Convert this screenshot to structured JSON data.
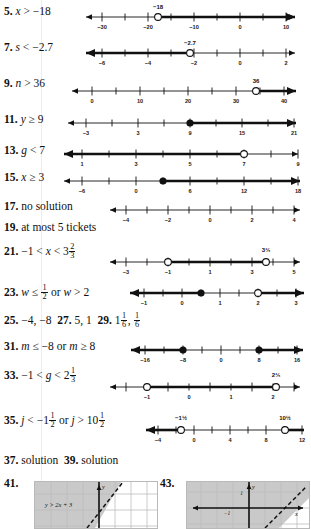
{
  "page": {
    "type": "textbook-answer-key",
    "background": "#ffffff",
    "ink": "#111111"
  },
  "items": [
    {
      "number": "5.",
      "answer": "x > −18",
      "variable": "x",
      "relation": ">",
      "value": "−18",
      "numberline": {
        "ticks": [
          "−30",
          "",
          "−20",
          "",
          "−10",
          "",
          "0",
          "",
          "10"
        ],
        "tick_values": [
          -30,
          -25,
          -20,
          -15,
          -10,
          -5,
          0,
          5,
          10
        ],
        "labeled": [
          -30,
          -20,
          -10,
          0,
          10
        ],
        "point_label": "−18",
        "point": -18,
        "circle": "open",
        "shade": "right",
        "arrow_left": true,
        "arrow_right": true
      }
    },
    {
      "number": "7.",
      "answer": "s < −2.7",
      "variable": "s",
      "relation": "<",
      "value": "−2.7",
      "numberline": {
        "ticks": [
          "−6",
          "",
          "−4",
          "",
          "−2",
          "",
          "0",
          "",
          "2"
        ],
        "tick_values": [
          -6,
          -5,
          -4,
          -3,
          -2,
          -1,
          0,
          1,
          2
        ],
        "labeled": [
          -6,
          -4,
          -2,
          0,
          2
        ],
        "point_label": "−2.7",
        "point": -2.7,
        "circle": "open",
        "shade": "left",
        "arrow_left": true,
        "arrow_right": true
      }
    },
    {
      "number": "9.",
      "answer": "n > 36",
      "variable": "n",
      "relation": ">",
      "value": "36",
      "numberline": {
        "ticks": [
          "0",
          "",
          "10",
          "",
          "20",
          "",
          "30",
          "",
          "40"
        ],
        "tick_values": [
          0,
          5,
          10,
          15,
          20,
          25,
          30,
          35,
          40
        ],
        "labeled": [
          0,
          10,
          20,
          30,
          40
        ],
        "point_label": "36",
        "point": 36,
        "circle": "open",
        "shade": "right",
        "arrow_left": true,
        "arrow_right": true
      }
    },
    {
      "number": "11.",
      "answer": "y ≥ 9",
      "variable": "y",
      "relation": "≥",
      "value": "9",
      "numberline": {
        "ticks": [
          "−3",
          "",
          "3",
          "",
          "9",
          "",
          "15",
          "",
          "21"
        ],
        "tick_values": [
          -3,
          0,
          3,
          6,
          9,
          12,
          15,
          18,
          21
        ],
        "labeled": [
          -3,
          3,
          9,
          15,
          21
        ],
        "point_label": "",
        "point": 9,
        "circle": "closed",
        "shade": "right",
        "arrow_left": true,
        "arrow_right": true
      }
    },
    {
      "number": "13.",
      "answer": "g < 7",
      "variable": "g",
      "relation": "<",
      "value": "7",
      "numberline": {
        "ticks": [
          "1",
          "",
          "3",
          "",
          "5",
          "",
          "7",
          "",
          "9"
        ],
        "tick_values": [
          1,
          2,
          3,
          4,
          5,
          6,
          7,
          8,
          9
        ],
        "labeled": [
          1,
          3,
          5,
          7,
          9
        ],
        "point_label": "",
        "point": 7,
        "circle": "open",
        "shade": "left",
        "arrow_left": true,
        "arrow_right": true
      }
    },
    {
      "number": "15.",
      "answer": "x ≥ 3",
      "variable": "x",
      "relation": "≥",
      "value": "3",
      "numberline": {
        "ticks": [
          "−6",
          "",
          "0",
          "",
          "6",
          "",
          "12",
          "",
          "18"
        ],
        "tick_values": [
          -6,
          -3,
          0,
          3,
          6,
          9,
          12,
          15,
          18
        ],
        "labeled": [
          -6,
          0,
          6,
          12,
          18
        ],
        "point_label": "",
        "point": 3,
        "circle": "closed",
        "shade": "right",
        "arrow_left": true,
        "arrow_right": true
      }
    },
    {
      "number": "17.",
      "answer": "no solution",
      "numberline": {
        "ticks": [
          "−4",
          "",
          "−2",
          "",
          "0",
          "",
          "2",
          "",
          "4"
        ],
        "tick_values": [
          -4,
          -3,
          -2,
          -1,
          0,
          1,
          2,
          3,
          4
        ],
        "labeled": [
          -4,
          -2,
          0,
          2,
          4
        ],
        "point_label": "",
        "point": null,
        "circle": "none",
        "shade": "none",
        "arrow_left": true,
        "arrow_right": true
      }
    },
    {
      "number": "19.",
      "answer": "at most 5 tickets"
    },
    {
      "number": "21.",
      "answer": "−1 < x < 3 2/3",
      "numberline": {
        "ticks": [
          "−3",
          "",
          "−1",
          "",
          "1",
          "",
          "3",
          "",
          "5"
        ],
        "tick_values": [
          -3,
          -2,
          -1,
          0,
          1,
          2,
          3,
          4,
          5
        ],
        "labeled": [
          -3,
          -1,
          1,
          3,
          5
        ],
        "point_label": "3⅔",
        "point": -1,
        "point2": 3.667,
        "circle": "open",
        "circle2": "open",
        "shade": "between",
        "arrow_left": true,
        "arrow_right": true
      }
    },
    {
      "number": "23.",
      "answer": "w ≤ 1/2 or w > 2",
      "numberline": {
        "ticks": [
          "−1",
          "",
          "0",
          "",
          "1",
          "",
          "2",
          "",
          "3"
        ],
        "tick_values": [
          -1,
          -0.5,
          0,
          0.5,
          1,
          1.5,
          2,
          2.5,
          3
        ],
        "labeled": [
          -1,
          0,
          1,
          2,
          3
        ],
        "point": 0.5,
        "point2": 2,
        "circle": "closed",
        "circle2": "open",
        "shade": "outside",
        "arrow_left": true,
        "arrow_right": true
      }
    },
    {
      "number": "25.",
      "answer": "−4, −8"
    },
    {
      "number": "27.",
      "answer": "5, 1"
    },
    {
      "number": "29.",
      "answer": "1 1/6, 1/6"
    },
    {
      "number": "31.",
      "answer": "m ≤ −8 or m ≥ 8",
      "numberline": {
        "ticks": [
          "−16",
          "",
          "−8",
          "",
          "0",
          "",
          "8",
          "",
          "16"
        ],
        "tick_values": [
          -16,
          -12,
          -8,
          -4,
          0,
          4,
          8,
          12,
          16
        ],
        "labeled": [
          -16,
          -8,
          0,
          8,
          16
        ],
        "point": -8,
        "point2": 8,
        "circle": "closed",
        "circle2": "closed",
        "shade": "outside",
        "arrow_left": true,
        "arrow_right": true
      }
    },
    {
      "number": "33.",
      "answer": "−1 < g < 2 1/3",
      "numberline": {
        "ticks": [
          "",
          "−1",
          "",
          "0",
          "",
          "1",
          "",
          "2",
          ""
        ],
        "tick_values": [
          -2,
          -1,
          -0.5,
          0,
          0.5,
          1,
          1.5,
          2,
          2.5
        ],
        "labeled": [
          -1,
          0,
          1,
          2
        ],
        "point_label": "2⅓",
        "point": -1,
        "point2": 2.333,
        "circle": "open",
        "circle2": "open",
        "shade": "between",
        "arrow_left": true,
        "arrow_right": true
      }
    },
    {
      "number": "35.",
      "answer": "j < −1 1/2 or j > 10 1/2",
      "numberline": {
        "ticks": [
          "−4",
          "",
          "0",
          "",
          "4",
          "",
          "8",
          "",
          "12"
        ],
        "tick_values": [
          -4,
          -2,
          0,
          2,
          4,
          6,
          8,
          10,
          12
        ],
        "labeled": [
          -4,
          0,
          4,
          8,
          12
        ],
        "point_label_left": "−1½",
        "point_label_right": "10½",
        "point": -1.5,
        "point2": 10.5,
        "circle": "open",
        "circle2": "open",
        "shade": "outside",
        "arrow_left": true,
        "arrow_right": true
      }
    },
    {
      "number": "37.",
      "answer": "solution"
    },
    {
      "number": "39.",
      "answer": "solution"
    }
  ],
  "graphs": [
    {
      "number": "41.",
      "inequality_label": "y > 2x + 3",
      "line_style": "dashed",
      "shaded_region": "upper-left",
      "shade_color": "#c9c9c9",
      "grid_color": "#c4c4c4",
      "axis_labels": {
        "y": "y",
        "x": ""
      }
    },
    {
      "number": "43.",
      "inequality_label": "",
      "line_style": "dashed",
      "shaded_region": "upper-left",
      "shade_color": "#c9c9c9",
      "grid_color": "#c4c4c4",
      "axis_labels": {
        "y": "y",
        "x": "x",
        "tick_pos": "1",
        "tick_neg": "−1"
      }
    }
  ]
}
